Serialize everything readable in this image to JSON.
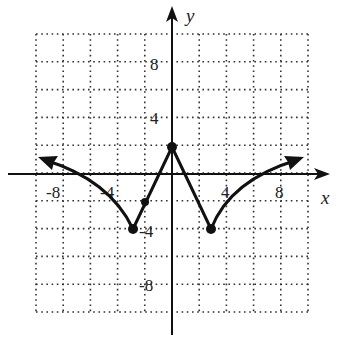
{
  "chart_data": {
    "type": "line",
    "title": "",
    "xlabel": "x",
    "ylabel": "y",
    "xlim": [
      -10,
      10
    ],
    "ylim": [
      -10,
      10
    ],
    "grid": true,
    "grid_step": 2,
    "x_tick_labels": [
      "-8",
      "-4",
      "4",
      "8"
    ],
    "y_tick_labels": [
      "8",
      "4",
      "-4",
      "-8"
    ],
    "series": [
      {
        "name": "f(x)",
        "points": [
          {
            "x": -10,
            "y": 1
          },
          {
            "x": -8,
            "y": 0.2
          },
          {
            "x": -6,
            "y": -1
          },
          {
            "x": -4,
            "y": -2.4
          },
          {
            "x": -3,
            "y": -4
          },
          {
            "x": -2,
            "y": -2
          },
          {
            "x": 0,
            "y": 2
          },
          {
            "x": 3,
            "y": -4
          },
          {
            "x": 4,
            "y": -2.4
          },
          {
            "x": 6,
            "y": -1
          },
          {
            "x": 8,
            "y": 0.2
          },
          {
            "x": 9.5,
            "y": 1
          }
        ],
        "marked_points": [
          {
            "x": 0,
            "y": 2
          },
          {
            "x": -2,
            "y": -2
          },
          {
            "x": -3,
            "y": -4
          },
          {
            "x": 3,
            "y": -4
          }
        ],
        "arrows": [
          "left",
          "right"
        ]
      }
    ]
  },
  "axes": {
    "x_label": "x",
    "y_label": "y"
  },
  "ticks": {
    "x": [
      {
        "value": -8,
        "label": "-8"
      },
      {
        "value": -4,
        "label": "-4"
      },
      {
        "value": 4,
        "label": "4"
      },
      {
        "value": 8,
        "label": "8"
      }
    ],
    "y": [
      {
        "value": 8,
        "label": "8"
      },
      {
        "value": 4,
        "label": "4"
      },
      {
        "value": -4,
        "label": "-4"
      },
      {
        "value": -8,
        "label": "-8"
      }
    ]
  }
}
